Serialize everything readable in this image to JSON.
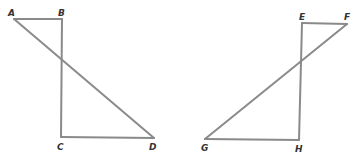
{
  "figures": [
    {
      "name": "figure-left",
      "points": {
        "A": {
          "label": "A",
          "x": 14,
          "y": 19,
          "lx": 8,
          "ly": 16
        },
        "B": {
          "label": "B",
          "x": 62,
          "y": 19,
          "lx": 58,
          "ly": 16
        },
        "C": {
          "label": "C",
          "x": 61,
          "y": 137,
          "lx": 57,
          "ly": 150
        },
        "D": {
          "label": "D",
          "x": 154,
          "y": 138,
          "lx": 149,
          "ly": 150
        }
      },
      "segments": [
        "AB",
        "BC",
        "CD",
        "AD"
      ]
    },
    {
      "name": "figure-right",
      "points": {
        "E": {
          "label": "E",
          "x": 302,
          "y": 23,
          "lx": 299,
          "ly": 20
        },
        "F": {
          "label": "F",
          "x": 347,
          "y": 24,
          "lx": 344,
          "ly": 20
        },
        "G": {
          "label": "G",
          "x": 205,
          "y": 139,
          "lx": 201,
          "ly": 151
        },
        "H": {
          "label": "H",
          "x": 299,
          "y": 140,
          "lx": 295,
          "ly": 152
        }
      },
      "segments": [
        "EF",
        "EH",
        "GH",
        "FG"
      ]
    }
  ],
  "colors": {
    "line": "#8a8a8a",
    "label": "#333333",
    "background": "#ffffff"
  }
}
